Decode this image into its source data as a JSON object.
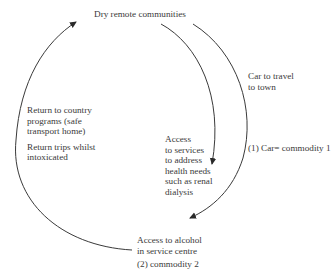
{
  "diagram": {
    "colors": {
      "line": "#3a3a3a",
      "text": "#3a3a3a",
      "background": "#ffffff"
    },
    "nodes": {
      "top": {
        "label": "Dry remote communities"
      },
      "bottom": {
        "lines": [
          "Access to alcohol",
          "in service centre"
        ],
        "tag": "(2) commodity 2"
      }
    },
    "edges": {
      "outer_right": {
        "lines": [
          "Car to travel",
          "to town"
        ],
        "tag": "(1) Car= commodity 1"
      },
      "inner_right": {
        "lines": [
          "Access",
          "to services",
          "to address",
          "health needs",
          "such as renal",
          "dialysis"
        ]
      },
      "left": {
        "lines_1": [
          "Return to country",
          "programs (safe",
          "transport home)"
        ],
        "lines_2": [
          "Return trips whilst",
          "intoxicated"
        ]
      }
    }
  }
}
